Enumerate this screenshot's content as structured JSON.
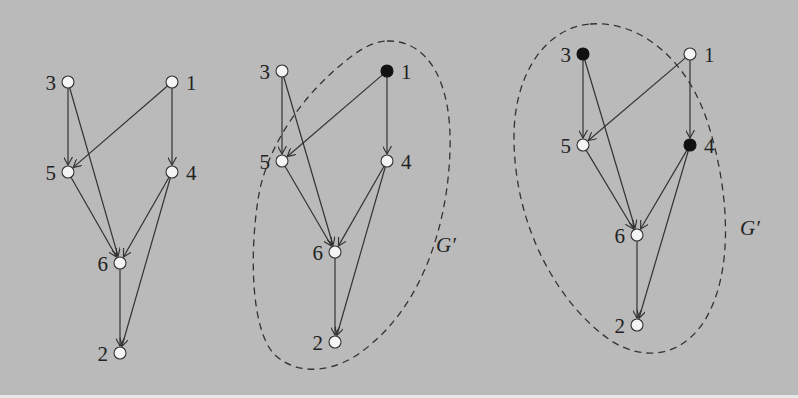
{
  "figure": {
    "background_color": "#bababa",
    "panels": [
      {
        "id": "panel-a",
        "nodes": [
          {
            "id": "3",
            "label": "3",
            "x": 68,
            "y": 82,
            "filled": false
          },
          {
            "id": "1",
            "label": "1",
            "x": 172,
            "y": 82,
            "filled": false
          },
          {
            "id": "5",
            "label": "5",
            "x": 68,
            "y": 172,
            "filled": false
          },
          {
            "id": "4",
            "label": "4",
            "x": 172,
            "y": 172,
            "filled": false
          },
          {
            "id": "6",
            "label": "6",
            "x": 120,
            "y": 263,
            "filled": false
          },
          {
            "id": "2",
            "label": "2",
            "x": 120,
            "y": 353,
            "filled": false
          }
        ],
        "edges": [
          [
            "3",
            "5"
          ],
          [
            "3",
            "6"
          ],
          [
            "1",
            "5"
          ],
          [
            "1",
            "4"
          ],
          [
            "5",
            "6"
          ],
          [
            "4",
            "6"
          ],
          [
            "4",
            "2"
          ],
          [
            "6",
            "2"
          ]
        ],
        "region": null
      },
      {
        "id": "panel-b",
        "nodes": [
          {
            "id": "3",
            "label": "3",
            "x": 282,
            "y": 71,
            "filled": false
          },
          {
            "id": "1",
            "label": "1",
            "x": 387,
            "y": 71,
            "filled": true
          },
          {
            "id": "5",
            "label": "5",
            "x": 282,
            "y": 161,
            "filled": false
          },
          {
            "id": "4",
            "label": "4",
            "x": 387,
            "y": 161,
            "filled": false
          },
          {
            "id": "6",
            "label": "6",
            "x": 335,
            "y": 252,
            "filled": false
          },
          {
            "id": "2",
            "label": "2",
            "x": 335,
            "y": 342,
            "filled": false
          }
        ],
        "edges": [
          [
            "3",
            "5"
          ],
          [
            "3",
            "6"
          ],
          [
            "1",
            "5"
          ],
          [
            "1",
            "4"
          ],
          [
            "5",
            "6"
          ],
          [
            "4",
            "6"
          ],
          [
            "4",
            "2"
          ],
          [
            "6",
            "2"
          ]
        ],
        "region": {
          "label": "G′",
          "label_x": 436,
          "label_y": 252
        }
      },
      {
        "id": "panel-c",
        "nodes": [
          {
            "id": "3",
            "label": "3",
            "x": 583,
            "y": 54,
            "filled": true
          },
          {
            "id": "1",
            "label": "1",
            "x": 690,
            "y": 54,
            "filled": false
          },
          {
            "id": "5",
            "label": "5",
            "x": 583,
            "y": 145,
            "filled": false
          },
          {
            "id": "4",
            "label": "4",
            "x": 690,
            "y": 145,
            "filled": true
          },
          {
            "id": "6",
            "label": "6",
            "x": 637,
            "y": 235,
            "filled": false
          },
          {
            "id": "2",
            "label": "2",
            "x": 637,
            "y": 325,
            "filled": false
          }
        ],
        "edges": [
          [
            "3",
            "5"
          ],
          [
            "3",
            "6"
          ],
          [
            "1",
            "5"
          ],
          [
            "1",
            "4"
          ],
          [
            "5",
            "6"
          ],
          [
            "4",
            "6"
          ],
          [
            "4",
            "2"
          ],
          [
            "6",
            "2"
          ]
        ],
        "region": {
          "label": "G′",
          "label_x": 740,
          "label_y": 235
        }
      }
    ]
  }
}
